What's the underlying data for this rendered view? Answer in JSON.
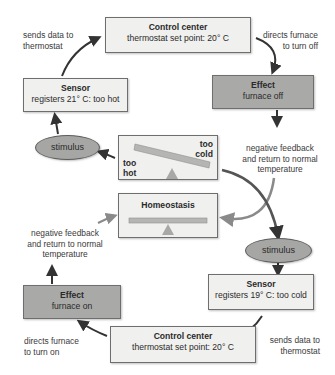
{
  "diagram": {
    "top_loop": {
      "control_center": {
        "title": "Control center",
        "detail": "thermostat set point: 20° C"
      },
      "sensor": {
        "title": "Sensor",
        "detail": "registers 21° C: too hot"
      },
      "effect": {
        "title": "Effect",
        "detail": "furnace off"
      },
      "stimulus": "stimulus",
      "label_sends": [
        "sends data to",
        "thermostat"
      ],
      "label_directs": [
        "directs furnace",
        "to turn off"
      ],
      "label_feedback": [
        "negative feedback",
        "and return to normal",
        "temperature"
      ]
    },
    "center": {
      "imbalance": {
        "left_label": [
          "too",
          "hot"
        ],
        "right_label": [
          "too",
          "cold"
        ]
      },
      "homeostasis": {
        "title": "Homeostasis"
      }
    },
    "bottom_loop": {
      "control_center": {
        "title": "Control center",
        "detail": "thermostat set point: 20° C"
      },
      "sensor": {
        "title": "Sensor",
        "detail": "registers 19° C: too cold"
      },
      "effect": {
        "title": "Effect",
        "detail": "furnace on"
      },
      "stimulus": "stimulus",
      "label_sends": [
        "sends data to",
        "thermostat"
      ],
      "label_directs": [
        "directs furnace",
        "to turn on"
      ],
      "label_feedback": [
        "negative feedback",
        "and return to normal",
        "temperature"
      ]
    },
    "colors": {
      "light_box": "#f0f0ee",
      "dark_box": "#a9a9a7",
      "arrow": "#333333",
      "arrow_gray": "#8a8a8a",
      "beam": "#b5b5b3"
    }
  }
}
